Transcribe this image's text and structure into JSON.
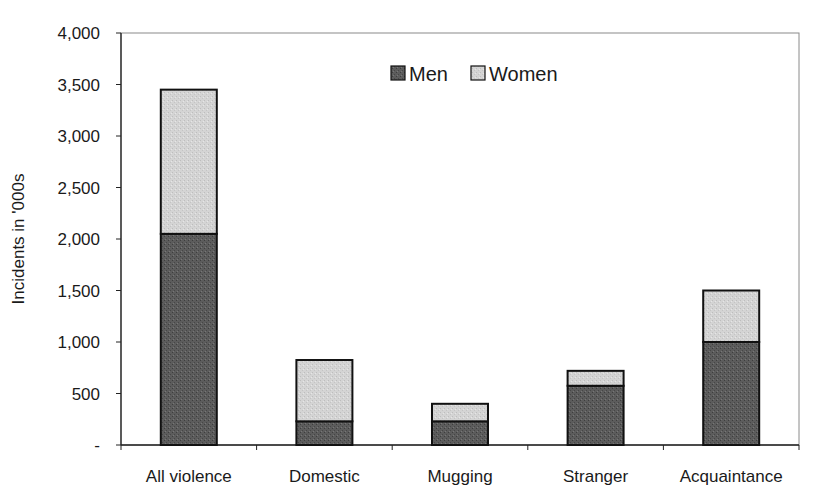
{
  "chart_data": {
    "type": "bar",
    "stacked": true,
    "title": "",
    "xlabel": "",
    "ylabel": "Incidents in '000s",
    "ylim": [
      0,
      4000
    ],
    "yticks": [
      0,
      500,
      1000,
      1500,
      2000,
      2500,
      3000,
      3500,
      4000
    ],
    "ytick_labels": [
      "-",
      "500",
      "1,000",
      "1,500",
      "2,000",
      "2,500",
      "3,000",
      "3,500",
      "4,000"
    ],
    "categories": [
      "All violence",
      "Domestic",
      "Mugging",
      "Stranger",
      "Acquaintance"
    ],
    "series": [
      {
        "name": "Men",
        "color": "#5a5a5a",
        "values": [
          2050,
          230,
          230,
          575,
          1000
        ]
      },
      {
        "name": "Women",
        "color": "#d2d2d2",
        "values": [
          1400,
          595,
          170,
          145,
          500
        ]
      }
    ],
    "grid": false,
    "legend_position": "top-center-inside"
  },
  "legend": {
    "men_label": "Men",
    "women_label": "Women"
  },
  "axis": {
    "ylabel": "Incidents in '000s"
  }
}
